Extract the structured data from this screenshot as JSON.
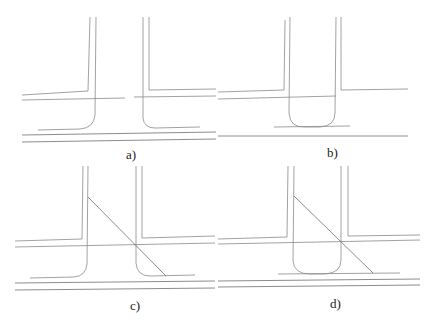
{
  "figure": {
    "panels": [
      {
        "id": "a",
        "label": "a)",
        "description": "T-junction with two rounded corners and a double horizontal road"
      },
      {
        "id": "b",
        "label": "b)",
        "description": "T-junction with a U-shaped rounded end of the vertical branch"
      },
      {
        "id": "c",
        "label": "c)",
        "description": "T-junction as in a) with a diagonal line crossing the junction"
      },
      {
        "id": "d",
        "label": "d)",
        "description": "T-junction as in b) with a diagonal line crossing the junction"
      }
    ],
    "line_color": "#8a8a8a",
    "background": "#ffffff"
  }
}
